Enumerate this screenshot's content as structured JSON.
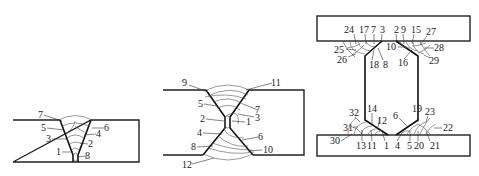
{
  "figures": [
    {
      "name": "single-v-butt-weld",
      "labels": [
        "7",
        "5",
        "3",
        "1",
        "6",
        "4",
        "2",
        "8"
      ]
    },
    {
      "name": "double-v-butt-weld",
      "labels": [
        "9",
        "5",
        "2",
        "4",
        "8",
        "12",
        "11",
        "7",
        "1",
        "3",
        "6",
        "10"
      ]
    },
    {
      "name": "i-beam-fillet-welds",
      "top_labels": [
        "24",
        "17",
        "7",
        "3",
        "2",
        "9",
        "15",
        "27",
        "25",
        "26",
        "18",
        "8",
        "10",
        "16",
        "28",
        "29"
      ],
      "bottom_labels": [
        "32",
        "14",
        "12",
        "31",
        "30",
        "13",
        "11",
        "1",
        "6",
        "19",
        "23",
        "22",
        "4",
        "5",
        "20",
        "21"
      ]
    }
  ]
}
